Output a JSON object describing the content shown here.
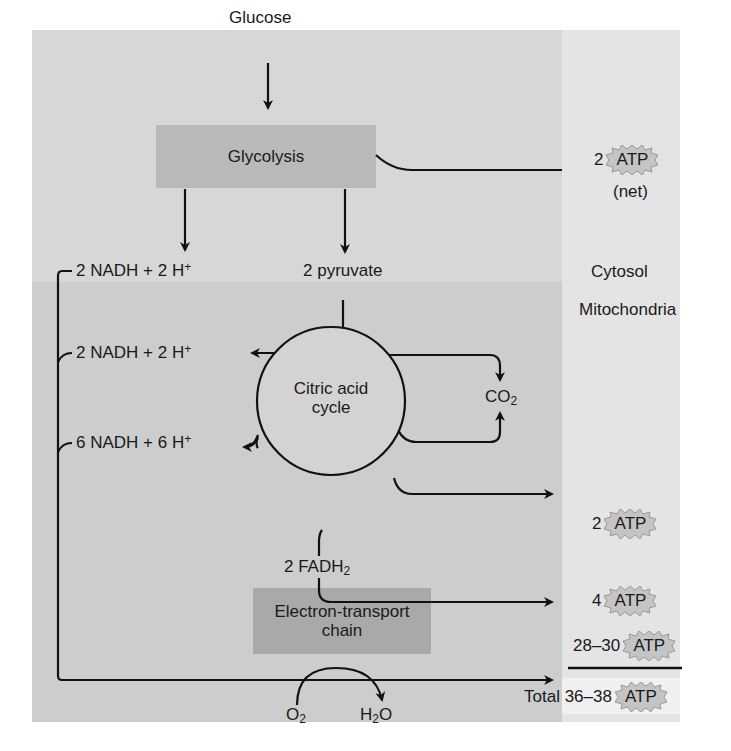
{
  "regions": {
    "cytosol": "Cytosol",
    "mitochondria": "Mitochondria"
  },
  "inputs": {
    "glucose": "Glucose",
    "o2_base": "O",
    "o2_sub": "2",
    "h2o_h": "H",
    "h2o_sub": "2",
    "h2o_o": "O"
  },
  "processes": {
    "glycolysis": "Glycolysis",
    "citric_acid_line1": "Citric acid",
    "citric_acid_line2": "cycle",
    "etc_line1": "Electron-transport",
    "etc_line2": "chain"
  },
  "intermediates": {
    "nadh_glycolysis": "2 NADH + 2 H",
    "nadh_glycolysis_sup": "+",
    "pyruvate": "2 pyruvate",
    "nadh_pyruvate": "2 NADH + 2 H",
    "nadh_pyruvate_sup": "+",
    "nadh_cycle": "6 NADH + 6 H",
    "nadh_cycle_sup": "+",
    "co2_base": "CO",
    "co2_sub": "2",
    "fadh2_base": "2 FADH",
    "fadh2_sub": "2"
  },
  "atp_yields": [
    {
      "amount": "2",
      "label": "ATP",
      "note": "(net)"
    },
    {
      "amount": "2",
      "label": "ATP"
    },
    {
      "amount": "4",
      "label": "ATP"
    },
    {
      "amount": "28–30",
      "label": "ATP"
    }
  ],
  "total": {
    "label": "Total 36–38",
    "atp": "ATP"
  },
  "colors": {
    "cytosol_panel": "#d7d7d7",
    "mito_panel": "#cdcdcd",
    "right_column": "#e4e4e4",
    "glycolysis_box": "#b9b9b9",
    "etc_box": "#a9a9a9",
    "atp_badge": "#c4c4c4"
  }
}
